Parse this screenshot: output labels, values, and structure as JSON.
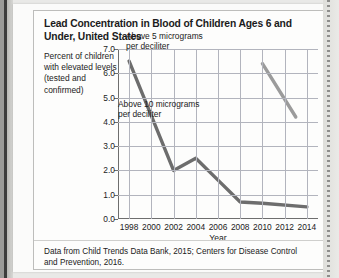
{
  "figure": {
    "title": "Lead Concentration in Blood of Children Ages 6 and Under, United States",
    "y_axis_caption": "Percent of children with elevated levels (tested and confirmed)",
    "x_axis_title": "Year",
    "source_note": "Data from Child Trends Data Bank, 2015; Centers for Disease Control and Prevention, 2016."
  },
  "chart_data": {
    "type": "line",
    "title": "Lead Concentration in Blood of Children Ages 6 and Under, United States",
    "xlabel": "Year",
    "ylabel": "Percent of children with elevated levels (tested and confirmed)",
    "xlim": [
      1997,
      2015
    ],
    "ylim": [
      0.0,
      7.0
    ],
    "xticks": [
      1998,
      2000,
      2002,
      2004,
      2006,
      2008,
      2010,
      2012,
      2014
    ],
    "yticks": [
      "0.0",
      "1.0",
      "2.0",
      "3.0",
      "4.0",
      "5.0",
      "6.0",
      "7.0"
    ],
    "grid": true,
    "legend_position": "inline-annotations",
    "series": [
      {
        "name": "Above 10 micrograms per deciliter",
        "annotation": "Above 10 micrograms per deciliter",
        "color": "#6d6d6d",
        "x": [
          1998,
          2002,
          2004,
          2006,
          2008,
          2010,
          2014
        ],
        "y": [
          6.5,
          2.0,
          2.5,
          1.6,
          0.7,
          0.65,
          0.5
        ]
      },
      {
        "name": "Above 5 micrograms per deciliter",
        "annotation": "Above 5 micrograms per deciliter",
        "color": "#9b9b9b",
        "x": [
          2010,
          2013
        ],
        "y": [
          6.4,
          4.2
        ]
      }
    ]
  },
  "colors": {
    "series_above_10": "#6d6d6d",
    "series_above_5": "#9b9b9b",
    "gridline": "#b2b4bd",
    "axis": "#6e6e6e",
    "card_background": "#fdfdfc",
    "page_background": "#e9e9e7"
  }
}
